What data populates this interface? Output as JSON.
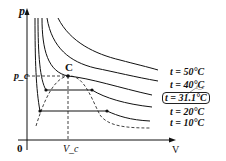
{
  "diagram": {
    "axes": {
      "y_label": "p",
      "x_label": "V",
      "origin_label": "0",
      "pc_label": "p_c",
      "vc_label": "V_c"
    },
    "critical_point_label": "C",
    "isotherms": [
      {
        "label": "t = 50°C"
      },
      {
        "label": "t = 40°C"
      },
      {
        "label": "t = 31.1°C",
        "boxed": true,
        "annotation": "tc"
      },
      {
        "label": "t = 20°C"
      },
      {
        "label": "t = 10°C"
      }
    ],
    "critical_annotation": "t_c"
  }
}
